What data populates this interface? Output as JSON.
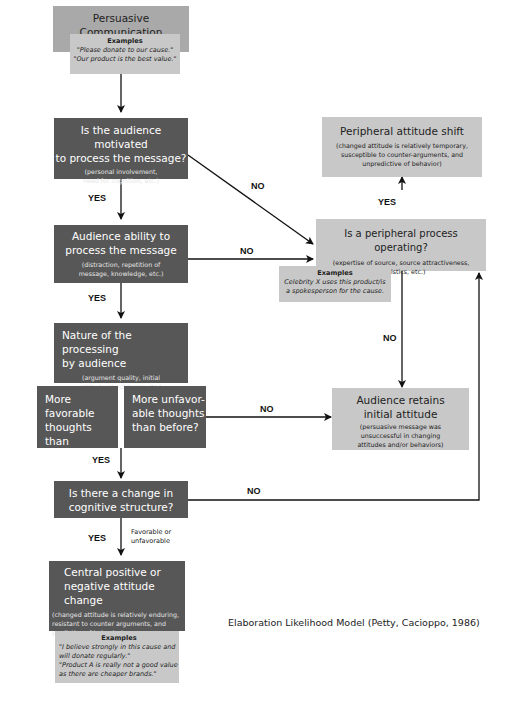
{
  "diagram": {
    "caption": "Elaboration Likelihood Model (Petty, Cacioppo, 1986)",
    "start": {
      "title": "Persuasive Communication",
      "examples_heading": "Examples",
      "examples": [
        "\"Please donate to our cause.\"",
        "\"Our product is the best value.\""
      ]
    },
    "motivation": {
      "title_lines": [
        "Is the audience motivated",
        "to process the message?"
      ],
      "sub_lines": [
        "(personal involvement,",
        "need for cognition, etc.)"
      ]
    },
    "ability": {
      "title_lines": [
        "Audience ability to",
        "process the message"
      ],
      "sub_lines": [
        "(distraction, repetition of",
        "message, knowledge, etc.)"
      ]
    },
    "nature": {
      "title_lines": [
        "Nature of the processing",
        "by audience"
      ],
      "sub_lines": [
        "(argument quality, initial",
        "attitude about topic, etc.)"
      ]
    },
    "favorable": {
      "lines": [
        "More favorable",
        "thoughts than",
        "before?"
      ]
    },
    "unfavorable": {
      "lines": [
        "More unfavor-",
        "able thoughts",
        "than before?"
      ]
    },
    "cognitive": {
      "title_lines": [
        "Is there a change in",
        "cognitive structure?"
      ]
    },
    "central": {
      "title_lines": [
        "Central positive or",
        "negative attitude change"
      ],
      "sub_lines": [
        "(changed attitude is relatively enduring,",
        "resistant to counter arguments, and",
        "predictive of behavior)"
      ],
      "examples_heading": "Examples",
      "examples": [
        "\"I believe strongly in this cause and",
        "will donate regularly.\"",
        "\"Product A is really not a good value",
        "as there are cheaper brands.\""
      ]
    },
    "peripheral_shift": {
      "title": "Peripheral attitude shift",
      "sub_lines": [
        "(changed attitude is relatively temporary,",
        "susceptible to counter-arguments, and",
        "unpredictive of behavior)"
      ]
    },
    "peripheral_process": {
      "title": "Is a peripheral process operating?",
      "sub_lines": [
        "(expertise of source, source attractiveness,",
        "heuristics, etc.)"
      ],
      "examples_heading": "Examples",
      "examples": [
        "Celebrity X uses this product/is",
        "a spokesperson for the cause."
      ]
    },
    "retains": {
      "title_lines": [
        "Audience retains",
        "initial attitude"
      ],
      "sub_lines": [
        "(persuasive message was",
        "unsuccessful in changing",
        "attitudes and/or behaviors)"
      ]
    },
    "labels": {
      "yes": "YES",
      "no": "NO",
      "favorable_or_unfavorable": [
        "Favorable or",
        "unfavorable"
      ]
    },
    "colors": {
      "dark_box": "#575757",
      "grey_box": "#a9a9a9",
      "light_box": "#c8c8c8",
      "arrow": "#111111"
    }
  }
}
